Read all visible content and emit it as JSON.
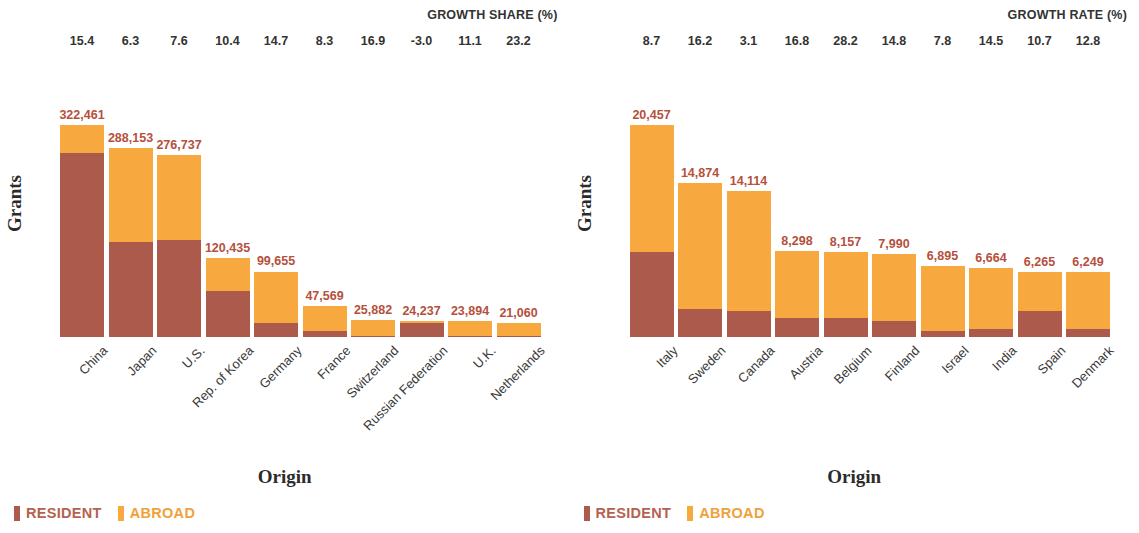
{
  "colors": {
    "resident": "#ab5a4b",
    "abroad": "#f7a93f",
    "value_label": "#b5503c",
    "header_text": "#333333"
  },
  "panels": [
    {
      "id": "growth-share",
      "growth_title": "GROWTH SHARE (%)",
      "y_title": "Grants",
      "x_title": "Origin",
      "legend": [
        {
          "key": "resident",
          "label": "RESIDENT"
        },
        {
          "key": "abroad",
          "label": "ABROAD"
        }
      ],
      "chart_data": {
        "type": "bar",
        "subtype": "stacked",
        "title": "GROWTH SHARE (%)",
        "xlabel": "Origin",
        "ylabel": "Grants",
        "categories": [
          "China",
          "Japan",
          "U.S.",
          "Rep. of Korea",
          "Germany",
          "France",
          "Switzerland",
          "Russian Federation",
          "U.K.",
          "Netherlands"
        ],
        "totals": [
          322461,
          288153,
          276737,
          120435,
          99655,
          47569,
          25882,
          24237,
          23894,
          21060
        ],
        "total_labels": [
          "322,461",
          "288,153",
          "276,737",
          "120,435",
          "99,655",
          "47,569",
          "25,882",
          "24,237",
          "23,894",
          "21,060"
        ],
        "growth_share_pct": [
          15.4,
          6.3,
          7.6,
          10.4,
          14.7,
          8.3,
          16.9,
          -3.0,
          11.1,
          23.2
        ],
        "growth_share_labels": [
          "15.4",
          "6.3",
          "7.6",
          "10.4",
          "14.7",
          "8.3",
          "16.9",
          "-3.0",
          "11.1",
          "23.2"
        ],
        "series": [
          {
            "name": "RESIDENT",
            "color": "#ab5a4b",
            "values": [
              280541,
              144077,
              147711,
              70455,
              21924,
              9514,
              2070,
              21328,
              2150,
              2106
            ]
          },
          {
            "name": "ABROAD",
            "color": "#f7a93f",
            "values": [
              41920,
              144076,
              129026,
              49980,
              77731,
              38055,
              23812,
              2909,
              21744,
              18954
            ]
          }
        ],
        "ylim": [
          0,
          322461
        ],
        "grid": false,
        "legend_position": "bottom-left"
      }
    },
    {
      "id": "growth-rate",
      "growth_title": "GROWTH RATE (%)",
      "y_title": "Grants",
      "x_title": "Origin",
      "legend": [
        {
          "key": "resident",
          "label": "RESIDENT"
        },
        {
          "key": "abroad",
          "label": "ABROAD"
        }
      ],
      "chart_data": {
        "type": "bar",
        "subtype": "stacked",
        "title": "GROWTH RATE (%)",
        "xlabel": "Origin",
        "ylabel": "Grants",
        "categories": [
          "Italy",
          "Sweden",
          "Canada",
          "Austria",
          "Belgium",
          "Finland",
          "Israel",
          "India",
          "Spain",
          "Denmark"
        ],
        "totals": [
          20457,
          14874,
          14114,
          8298,
          8157,
          7990,
          6895,
          6664,
          6265,
          6249
        ],
        "total_labels": [
          "20,457",
          "14,874",
          "14,114",
          "8,298",
          "8,157",
          "7,990",
          "6,895",
          "6,664",
          "6,265",
          "6,249"
        ],
        "growth_rate_pct": [
          8.7,
          16.2,
          3.1,
          16.8,
          28.2,
          14.8,
          7.8,
          14.5,
          10.7,
          12.8
        ],
        "growth_rate_labels": [
          "8.7",
          "16.2",
          "3.1",
          "16.8",
          "28.2",
          "14.8",
          "7.8",
          "14.5",
          "10.7",
          "12.8"
        ],
        "series": [
          {
            "name": "RESIDENT",
            "color": "#ab5a4b",
            "values": [
              8183,
              2678,
              2541,
              1826,
              1876,
              1518,
              620,
              733,
              2506,
              812
            ]
          },
          {
            "name": "ABROAD",
            "color": "#f7a93f",
            "values": [
              12274,
              12196,
              11573,
              6472,
              6281,
              6472,
              6275,
              5931,
              3759,
              5437
            ]
          }
        ],
        "ylim": [
          0,
          20457
        ],
        "grid": false,
        "legend_position": "bottom-left"
      }
    }
  ]
}
